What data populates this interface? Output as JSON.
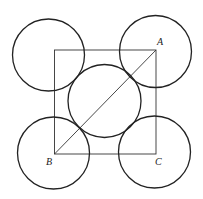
{
  "diagram": {
    "stroke_color": "#222222",
    "background": "#ffffff",
    "square": {
      "x": 54.5,
      "y": 50,
      "width": 101.5,
      "height": 104
    },
    "diagonal": {
      "from": "B",
      "to": "A",
      "x1": 54.5,
      "y1": 154,
      "x2": 156,
      "y2": 50
    },
    "circles": [
      {
        "id": "top-left",
        "cx": 48.5,
        "cy": 55,
        "r": 36
      },
      {
        "id": "top-right",
        "cx": 155.5,
        "cy": 51.5,
        "r": 36
      },
      {
        "id": "center",
        "cx": 104.5,
        "cy": 101,
        "r": 36.5
      },
      {
        "id": "bottom-left",
        "cx": 53.5,
        "cy": 153,
        "r": 36
      },
      {
        "id": "bottom-right",
        "cx": 154.5,
        "cy": 152,
        "r": 36
      }
    ],
    "points": [
      {
        "label": "A",
        "x": 156,
        "y": 50,
        "label_x": 157,
        "label_y": 45
      },
      {
        "label": "B",
        "x": 54.5,
        "y": 154,
        "label_x": 46,
        "label_y": 165
      },
      {
        "label": "C",
        "x": 156,
        "y": 154,
        "label_x": 155,
        "label_y": 165
      }
    ]
  }
}
